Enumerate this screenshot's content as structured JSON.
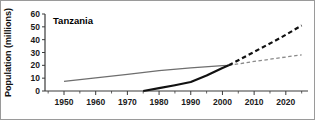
{
  "chart_data": {
    "type": "line",
    "title": "Tanzania",
    "xlabel": "",
    "ylabel": "Population (millions)",
    "xlim": [
      1944,
      2027
    ],
    "ylim": [
      0,
      60
    ],
    "grid": false,
    "legend_position": "none",
    "x_ticks": [
      1950,
      1960,
      1970,
      1980,
      1990,
      2000,
      2010,
      2020
    ],
    "x_tick_labels": [
      "1950",
      "1960",
      "1970",
      "1980",
      "1990",
      "2000",
      "2010",
      "2020"
    ],
    "x_minor_ticks": [
      1945,
      1955,
      1965,
      1975,
      1985,
      1995,
      2005,
      2015,
      2025
    ],
    "y_ticks": [
      0,
      10,
      20,
      30,
      40,
      50,
      60
    ],
    "y_tick_labels": [
      "0",
      "10",
      "20",
      "30",
      "40",
      "50",
      "60"
    ],
    "series": [
      {
        "name": "without-epidemic-projection",
        "color": "#6e6e6e",
        "width": 1.3,
        "style": "solid",
        "x": [
          1950,
          1960,
          1970,
          1980,
          1990,
          2000,
          2002
        ],
        "values": [
          7.5,
          10.2,
          13.0,
          15.8,
          18.0,
          19.7,
          20.0
        ]
      },
      {
        "name": "without-epidemic-projection-dashed",
        "color": "#8a8a8a",
        "width": 1.3,
        "style": "dashed",
        "x": [
          2002,
          2010,
          2018,
          2025
        ],
        "values": [
          20.0,
          23.0,
          25.8,
          28.2
        ]
      },
      {
        "name": "with-epidemic-observed",
        "color": "#111111",
        "width": 2.2,
        "style": "solid",
        "x": [
          1975,
          1980,
          1985,
          1990,
          1995,
          2000,
          2002
        ],
        "values": [
          0.0,
          2.2,
          4.5,
          7.0,
          12.0,
          18.0,
          20.0
        ]
      },
      {
        "name": "with-epidemic-projection-dashed",
        "color": "#111111",
        "width": 2.2,
        "style": "dashed",
        "x": [
          2002,
          2010,
          2018,
          2025
        ],
        "values": [
          20.0,
          30.5,
          41.0,
          51.0
        ]
      }
    ]
  }
}
